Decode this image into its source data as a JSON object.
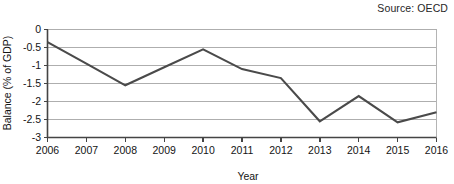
{
  "source_note": "Source: OECD",
  "chart_data": {
    "type": "line",
    "title": "",
    "xlabel": "Year",
    "ylabel": "Balance (% of GDP)",
    "categories": [
      "2006",
      "2007",
      "2008",
      "2009",
      "2010",
      "2011",
      "2012",
      "2013",
      "2014",
      "2015",
      "2016"
    ],
    "x": [
      2006,
      2007,
      2008,
      2009,
      2010,
      2011,
      2012,
      2013,
      2014,
      2015,
      2016
    ],
    "values": [
      -0.35,
      -0.95,
      -1.55,
      -1.05,
      -0.55,
      -1.1,
      -1.35,
      -2.55,
      -1.85,
      -2.58,
      -2.3
    ],
    "series": [
      {
        "name": "Balance (% of GDP)",
        "color": "#4a4a4a",
        "values": [
          -0.35,
          -0.95,
          -1.55,
          -1.05,
          -0.55,
          -1.1,
          -1.35,
          -2.55,
          -1.85,
          -2.58,
          -2.3
        ]
      }
    ],
    "ylim": [
      -3,
      0
    ],
    "xlim": [
      2006,
      2016
    ],
    "ytick_labels": [
      "0",
      "-0.5",
      "-1",
      "-1.5",
      "-2",
      "-2.5",
      "-3"
    ],
    "ytick_values": [
      0,
      -0.5,
      -1,
      -1.5,
      -2,
      -2.5,
      -3
    ],
    "xtick_labels": [
      "2006",
      "2007",
      "2008",
      "2009",
      "2010",
      "2011",
      "2012",
      "2013",
      "2014",
      "2015",
      "2016"
    ],
    "grid": true,
    "grid_axis": "y",
    "legend": false,
    "legend_position": "none"
  }
}
